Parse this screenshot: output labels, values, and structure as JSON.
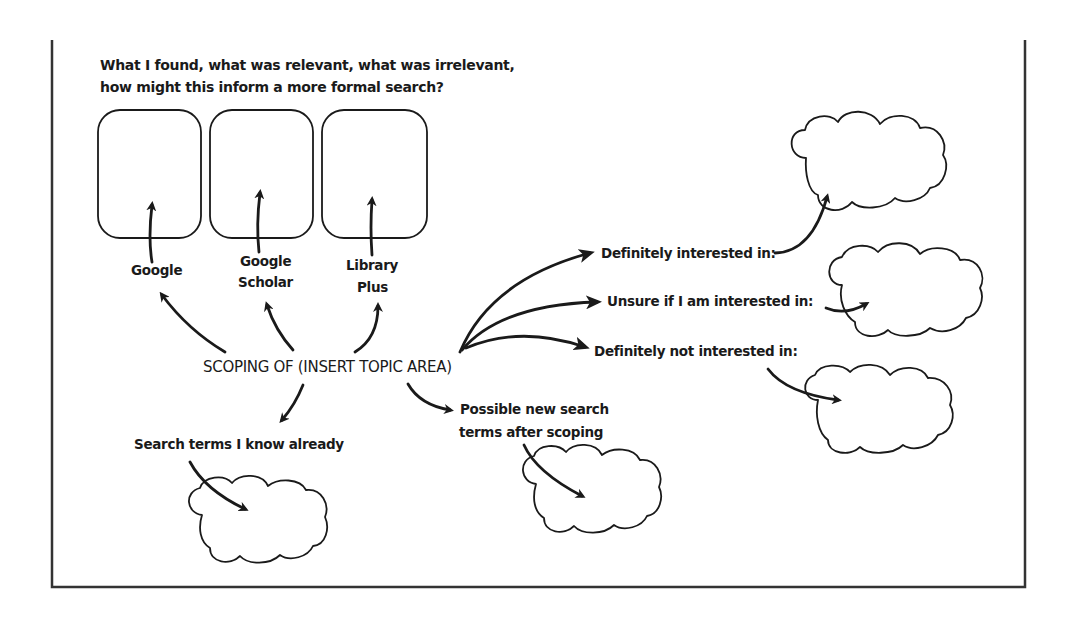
{
  "diagram": {
    "type": "mind-map / scoping worksheet",
    "header_text": {
      "line1": "What I found, what was relevant, what was irrelevant,",
      "line2": "how might this inform a more formal search?"
    },
    "central_node": "SCOPING OF (INSERT TOPIC AREA)",
    "sources": [
      {
        "label_lines": [
          "Google"
        ]
      },
      {
        "label_lines": [
          "Google",
          "Scholar"
        ]
      },
      {
        "label_lines": [
          "Library",
          "Plus"
        ]
      }
    ],
    "interest_branches": [
      {
        "label": "Definitely interested in:"
      },
      {
        "label": "Unsure if I am interested in:"
      },
      {
        "label": "Definitely not interested in:"
      }
    ],
    "search_terms": {
      "known": "Search terms I know already",
      "new_line1": "Possible new search",
      "new_line2": "terms after scoping"
    }
  },
  "colors": {
    "ink": "#1a1a1a",
    "frame": "#333333",
    "background": "#ffffff"
  }
}
